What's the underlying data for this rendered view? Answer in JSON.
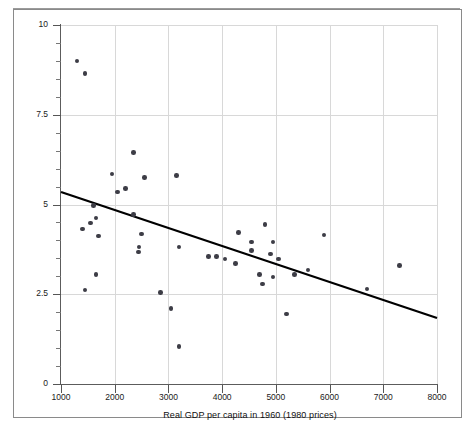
{
  "chart_data": {
    "type": "scatter",
    "title": "",
    "xlabel": "Real GDP per capita in 1960 (1980 prices)",
    "ylabel": "Growth rate of real GDP, 1960–85 (% per year)",
    "xlim": [
      1000,
      8000
    ],
    "ylim": [
      0,
      10
    ],
    "xticks": [
      1000,
      2000,
      3000,
      4000,
      5000,
      6000,
      7000,
      8000
    ],
    "xticklabels": [
      "1000",
      "2000",
      "3000",
      "4000",
      "5000",
      "6000",
      "7000",
      "8000"
    ],
    "yticks": [
      0,
      2.5,
      5,
      7.5,
      10
    ],
    "yticklabels": [
      "0",
      "2.5",
      "5",
      "7.5",
      "10"
    ],
    "y_minor_ticks": [
      0.5,
      1,
      1.5,
      2,
      3,
      3.5,
      4,
      4.5,
      5.5,
      6,
      6.5,
      7,
      8,
      8.5,
      9,
      9.5
    ],
    "grid": true,
    "grid_color": "#d8d8d8",
    "legend": null,
    "point_color": "#3d3d46",
    "line_color": "#000000",
    "series": [
      {
        "name": "Countries",
        "marker": "circle",
        "points": [
          {
            "x": 1300,
            "y": 9.0
          },
          {
            "x": 1450,
            "y": 8.65
          },
          {
            "x": 2350,
            "y": 6.45
          },
          {
            "x": 1950,
            "y": 5.85
          },
          {
            "x": 2550,
            "y": 5.75
          },
          {
            "x": 3150,
            "y": 5.8
          },
          {
            "x": 2200,
            "y": 5.45
          },
          {
            "x": 1600,
            "y": 4.98
          },
          {
            "x": 2050,
            "y": 5.35
          },
          {
            "x": 2350,
            "y": 4.72
          },
          {
            "x": 1650,
            "y": 4.62
          },
          {
            "x": 1550,
            "y": 4.48
          },
          {
            "x": 1400,
            "y": 4.32
          },
          {
            "x": 1700,
            "y": 4.12
          },
          {
            "x": 2500,
            "y": 4.18
          },
          {
            "x": 2450,
            "y": 3.82
          },
          {
            "x": 2440,
            "y": 3.68
          },
          {
            "x": 3200,
            "y": 3.82
          },
          {
            "x": 3750,
            "y": 3.55
          },
          {
            "x": 3900,
            "y": 3.55
          },
          {
            "x": 4050,
            "y": 3.48
          },
          {
            "x": 4300,
            "y": 4.22
          },
          {
            "x": 4550,
            "y": 3.95
          },
          {
            "x": 4800,
            "y": 4.45
          },
          {
            "x": 4950,
            "y": 3.95
          },
          {
            "x": 4550,
            "y": 3.72
          },
          {
            "x": 4900,
            "y": 3.62
          },
          {
            "x": 5050,
            "y": 3.48
          },
          {
            "x": 4250,
            "y": 3.35
          },
          {
            "x": 4700,
            "y": 3.05
          },
          {
            "x": 4950,
            "y": 2.98
          },
          {
            "x": 4750,
            "y": 2.78
          },
          {
            "x": 5350,
            "y": 3.05
          },
          {
            "x": 5600,
            "y": 3.18
          },
          {
            "x": 5900,
            "y": 4.15
          },
          {
            "x": 5200,
            "y": 1.95
          },
          {
            "x": 6700,
            "y": 2.65
          },
          {
            "x": 7300,
            "y": 3.3
          },
          {
            "x": 1650,
            "y": 3.05
          },
          {
            "x": 1450,
            "y": 2.62
          },
          {
            "x": 2850,
            "y": 2.55
          },
          {
            "x": 3050,
            "y": 2.1
          },
          {
            "x": 3200,
            "y": 1.05
          }
        ]
      }
    ],
    "trendline": {
      "name": "fitted regression line",
      "x_start": 1000,
      "y_start": 5.35,
      "x_end": 8000,
      "y_end": 1.84
    }
  }
}
